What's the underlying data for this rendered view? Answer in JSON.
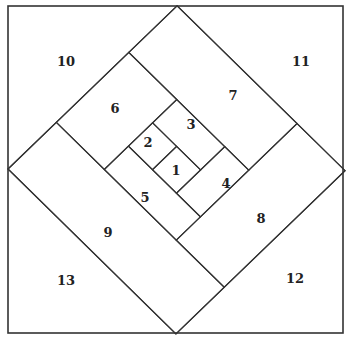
{
  "diagram": {
    "title": "",
    "type": "log-cabin quilt block piecing order",
    "unit": 33.6,
    "pieces": [
      {
        "id": "1",
        "label": "1",
        "a": [
          3,
          4
        ],
        "b": [
          3,
          4
        ],
        "x": 176,
        "y": 170
      },
      {
        "id": "2",
        "label": "2",
        "a": [
          3,
          4
        ],
        "b": [
          2,
          3
        ],
        "x": 148,
        "y": 142
      },
      {
        "id": "3",
        "label": "3",
        "a": [
          4,
          5
        ],
        "b": [
          2,
          4
        ],
        "x": 191,
        "y": 124
      },
      {
        "id": "4",
        "label": "4",
        "a": [
          3,
          5
        ],
        "b": [
          4,
          5
        ],
        "x": 226,
        "y": 183
      },
      {
        "id": "5",
        "label": "5",
        "a": [
          2,
          3
        ],
        "b": [
          2,
          5
        ],
        "x": 145,
        "y": 197
      },
      {
        "id": "6",
        "label": "6",
        "a": [
          2,
          5
        ],
        "b": [
          0,
          2
        ],
        "x": 115,
        "y": 108
      },
      {
        "id": "7",
        "label": "7",
        "a": [
          5,
          7
        ],
        "b": [
          0,
          5
        ],
        "x": 233,
        "y": 95
      },
      {
        "id": "8",
        "label": "8",
        "a": [
          2,
          7
        ],
        "b": [
          5,
          7
        ],
        "x": 261,
        "y": 218
      },
      {
        "id": "9",
        "label": "9",
        "a": [
          0,
          2
        ],
        "b": [
          0,
          7
        ],
        "x": 108,
        "y": 232
      },
      {
        "id": "10",
        "label": "10",
        "corner": "top-left",
        "x": 66,
        "y": 61
      },
      {
        "id": "11",
        "label": "11",
        "corner": "top-right",
        "x": 301,
        "y": 61
      },
      {
        "id": "12",
        "label": "12",
        "corner": "bottom-right",
        "x": 295,
        "y": 278
      },
      {
        "id": "13",
        "label": "13",
        "corner": "bottom-left",
        "x": 66,
        "y": 280
      }
    ],
    "colors": {
      "line": "#333333",
      "background": "#ffffff",
      "text": "#222222"
    }
  }
}
